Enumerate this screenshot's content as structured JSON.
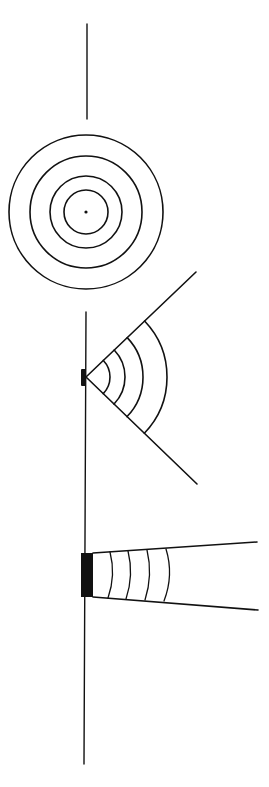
{
  "colors": {
    "stroke": "#111111",
    "background": "#ffffff",
    "fill": "#111111"
  },
  "figures": [
    {
      "name": "point-source-omnidirectional",
      "axis_line": {
        "x": 87,
        "y1": 24,
        "y2": 119
      },
      "center": {
        "x": 86,
        "y": 212
      },
      "rings": [
        22,
        36,
        56,
        77
      ],
      "dot_radius": 1.6
    },
    {
      "name": "small-source-wide-dispersion",
      "wall_line": {
        "x": 86,
        "y1": 312,
        "y2": 764
      },
      "source": {
        "x": 81,
        "y": 369,
        "w": 5,
        "h": 17
      },
      "apex": {
        "x": 86,
        "y": 377
      },
      "rays": [
        {
          "x": 196,
          "y": 272
        },
        {
          "x": 197,
          "y": 484
        }
      ],
      "arcs": [
        24,
        39,
        57,
        81
      ]
    },
    {
      "name": "large-source-narrow-beam",
      "source": {
        "x": 81,
        "y": 553,
        "w": 12,
        "h": 44
      },
      "beam_top": {
        "x1": 93,
        "y1": 553,
        "x2": 257,
        "y2": 542
      },
      "beam_bottom": {
        "x1": 93,
        "y1": 597,
        "x2": 258,
        "y2": 610
      },
      "wavefronts": [
        {
          "x_top": 110,
          "x_mid": 113,
          "y_top": 552,
          "y_bot": 598
        },
        {
          "x_top": 128,
          "x_mid": 131,
          "y_top": 551,
          "y_bot": 599
        },
        {
          "x_top": 147,
          "x_mid": 150,
          "y_top": 550,
          "y_bot": 600
        },
        {
          "x_top": 166,
          "x_mid": 170,
          "y_top": 549,
          "y_bot": 601
        }
      ]
    }
  ]
}
